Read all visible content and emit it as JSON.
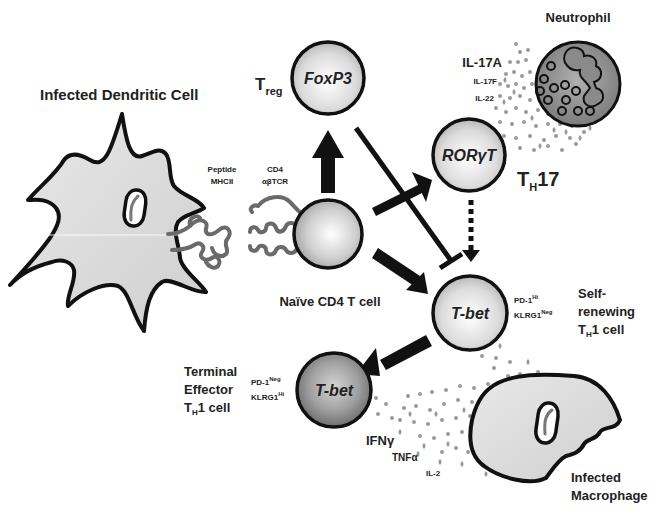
{
  "colors": {
    "outline": "#111111",
    "cell_fill_light": "#e4e4e4",
    "cell_fill_dark": "#8a8a8a",
    "dc_fill": "#dcdcdc",
    "neutrophil_fill": "#8f8f8f",
    "cytokine_dot": "#9a9a9a",
    "receptor": "#7a7a7a"
  },
  "cells": {
    "dendritic": {
      "label": "Infected Dendritic Cell"
    },
    "naive": {
      "label": "Naïve CD4 T cell"
    },
    "treg": {
      "prefix": "T",
      "sub": "reg",
      "factor": "FoxP3"
    },
    "th17": {
      "prefix": "T",
      "sub": "H",
      "suffix": "17",
      "factor": "RORγT"
    },
    "th1_self": {
      "factor": "T-bet",
      "marker1": "PD-1",
      "marker1_sup": "Hi",
      "marker2": "KLRG1",
      "marker2_sup": "Neg",
      "label_line1": "Self-",
      "label_line2": "renewing",
      "label_line3_prefix": "T",
      "label_line3_sub": "H",
      "label_line3_suffix": "1 cell"
    },
    "th1_terminal": {
      "factor": "T-bet",
      "marker1": "PD-1",
      "marker1_sup": "Neg",
      "marker2": "KLRG1",
      "marker2_sup": "Hi",
      "label_line1": "Terminal",
      "label_line2": "Effector",
      "label_line3_prefix": "T",
      "label_line3_sub": "H",
      "label_line3_suffix": "1 cell"
    },
    "neutrophil": {
      "label": "Neutrophil"
    },
    "macrophage": {
      "label_line1": "Infected",
      "label_line2": "Macrophage"
    }
  },
  "receptors": {
    "mhc": {
      "line1": "Peptide",
      "line2": "MHCII"
    },
    "tcr": {
      "line1": "CD4",
      "line2": "αβTCR"
    }
  },
  "cytokines": {
    "th17": [
      "IL-17A",
      "IL-17F",
      "IL-22"
    ],
    "th1": [
      "IFNγ",
      "TNFα",
      "IL-2"
    ]
  },
  "arrows": [
    {
      "from": "naive",
      "to": "treg",
      "type": "solid"
    },
    {
      "from": "naive",
      "to": "th17",
      "type": "solid"
    },
    {
      "from": "naive",
      "to": "th1_self",
      "type": "solid"
    },
    {
      "from": "treg",
      "to": "th1_self",
      "type": "inhibition"
    },
    {
      "from": "th17",
      "to": "th1_self",
      "type": "dashed"
    },
    {
      "from": "th1_self",
      "to": "th1_terminal",
      "type": "solid"
    }
  ]
}
